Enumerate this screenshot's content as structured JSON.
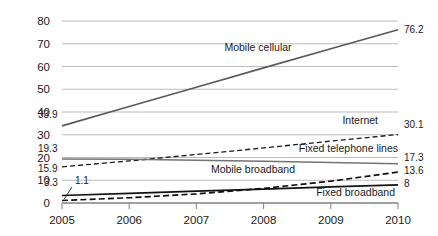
{
  "chart_data": {
    "type": "line",
    "title": "",
    "subtitle": "",
    "xlabel": "",
    "ylabel": "",
    "x": [
      2005,
      2006,
      2007,
      2008,
      2009,
      2010
    ],
    "categories": [
      "2005",
      "2006",
      "2007",
      "2008",
      "2009",
      "2010"
    ],
    "xlim": [
      2005,
      2010
    ],
    "ylim": [
      0,
      80
    ],
    "y_ticks": [
      0,
      10,
      20,
      30,
      40,
      50,
      60,
      70,
      80
    ],
    "y_tick_labels": [
      "0",
      "10",
      "20",
      "30",
      "40",
      "50",
      "60",
      "70",
      "80"
    ],
    "x_ticks": [
      2005,
      2006,
      2007,
      2008,
      2009,
      2010
    ],
    "x_tick_labels": [
      "2005",
      "2006",
      "2007",
      "2008",
      "2009",
      "2010"
    ],
    "grid": "horizontal",
    "legend": "inline-annotations",
    "series": [
      {
        "name": "Mobile cellular",
        "style": "solid",
        "width": 1.6,
        "color": "#595959",
        "values": [
          33.9,
          42.4,
          50.9,
          59.4,
          67.8,
          76.2
        ],
        "start_label": "33.9",
        "end_label": "76.2",
        "label": "Mobile cellular"
      },
      {
        "name": "Internet",
        "style": "dashed",
        "width": 1.3,
        "color": "#1a1a1a",
        "values": [
          15.9,
          18.5,
          21.3,
          24.2,
          27.2,
          30.1
        ],
        "start_label": "15.9",
        "end_label": "30.1",
        "label": "Internet"
      },
      {
        "name": "Fixed telephone lines",
        "style": "solid",
        "width": 1.5,
        "color": "#737373",
        "values": [
          19.3,
          19.2,
          18.8,
          18.4,
          17.8,
          17.3
        ],
        "start_label": "19.3",
        "end_label": "17.3",
        "label": "Fixed telephone lines"
      },
      {
        "name": "Mobile broadband",
        "style": "dashed",
        "width": 1.7,
        "color": "#111111",
        "values": [
          1.1,
          2.3,
          4.0,
          6.4,
          9.6,
          13.6
        ],
        "start_label": "1.1",
        "end_label": "13.6",
        "label": "Mobile broadband"
      },
      {
        "name": "Fixed broadband",
        "style": "solid",
        "width": 1.7,
        "color": "#111111",
        "values": [
          3.3,
          4.2,
          5.2,
          6.1,
          7.1,
          8.0
        ],
        "start_label": "3.3",
        "end_label": "8",
        "label": "Fixed broadband"
      }
    ],
    "annotations": [
      {
        "text": "Mobile cellular",
        "x": 258,
        "y": 51,
        "anchor": "middle"
      },
      {
        "text": "Internet",
        "x": 378,
        "y": 124,
        "anchor": "end"
      },
      {
        "text": "Fixed telephone lines",
        "x": 398,
        "y": 152,
        "anchor": "end"
      },
      {
        "text": "Mobile broadband",
        "x": 295,
        "y": 173,
        "anchor": "end"
      },
      {
        "text": "Fixed broadband",
        "x": 395,
        "y": 196,
        "anchor": "end"
      }
    ],
    "left_value_labels": [
      {
        "text": "33.9",
        "x": 38,
        "y": 118
      },
      {
        "text": "19.3",
        "x": 38,
        "y": 152
      },
      {
        "text": "15.9",
        "x": 38,
        "y": 172
      },
      {
        "text": "3.3",
        "x": 44,
        "y": 186
      },
      {
        "text": "1.1",
        "x": 75,
        "y": 184
      }
    ],
    "right_value_labels": [
      {
        "text": "76.2",
        "x": 404,
        "y": 33
      },
      {
        "text": "30.1",
        "x": 404,
        "y": 128
      },
      {
        "text": "17.3",
        "x": 404,
        "y": 161
      },
      {
        "text": "13.6",
        "x": 404,
        "y": 174
      },
      {
        "text": "8",
        "x": 404,
        "y": 187
      }
    ],
    "colors": {
      "grid": "#b3b3b3",
      "axis": "#808080",
      "text": "#1a1a1a",
      "background": "#ffffff"
    }
  }
}
